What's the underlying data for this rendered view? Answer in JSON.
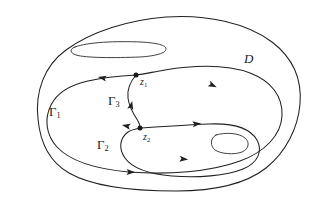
{
  "figure": {
    "kind": "contour-diagram",
    "background_color": "#ffffff",
    "ink_color": "#231f20",
    "labels": {
      "domain": {
        "text": "D",
        "x": 244,
        "y": 52
      },
      "gamma1": {
        "base": "Γ",
        "sub": "1",
        "x": 49,
        "y": 105
      },
      "gamma2": {
        "base": "Γ",
        "sub": "2",
        "x": 97,
        "y": 138
      },
      "gamma3": {
        "base": "Γ",
        "sub": "3",
        "x": 108,
        "y": 94
      },
      "z1": {
        "base": "z",
        "sub": "1",
        "x": 140,
        "y": 77
      },
      "z2": {
        "base": "z",
        "sub": "2",
        "x": 143,
        "y": 132
      }
    },
    "nodes": [
      {
        "name": "z1",
        "cx": 136,
        "cy": 75,
        "r": 2.5
      },
      {
        "name": "z2",
        "cx": 140,
        "cy": 128,
        "r": 2.5
      }
    ],
    "paths": {
      "outer_boundary": "M 38 119 C 35 92 44 66 66 50 C 92 31 129 20 166 17 C 206 14 247 23 272 42 C 293 58 302 80 300 104 C 298 128 286 152 266 168 C 243 186 210 191 176 191 C 137 191 95 188 69 173 C 48 161 40 141 38 119 Z",
      "slit_hole": "M 75 47 C 88 42 116 41 141 42 C 157 43 166 45 166 49 C 166 53 156 56 140 57 C 114 58 86 58 76 55 C 70 53 69 49 75 47 Z",
      "gamma1": "M 136 75 C 118 76 101 78 88 81 C 70 85 57 93 51 105 C 44 119 46 135 57 147 C 70 161 96 169 129 172 C 168 175 210 172 240 161 C 265 152 281 135 282 116 C 283 96 271 81 250 73 C 224 63 188 66 165 70 C 153 72 144 74 136 75 Z",
      "gamma2": "M 140 128 C 160 127 186 125 209 124 C 232 123 250 128 257 140 C 263 151 258 163 243 169 C 226 176 197 178 172 176 C 149 174 132 168 125 158 C 118 148 120 138 128 132 C 131 130 135 129 140 128 Z",
      "gamma3": "M 136 75 C 130 82 127 90 128 98 C 129 107 134 115 138 121 C 140 124 140 126 140 128",
      "blob_hole": "M 216 135 C 226 132 239 133 245 138 C 250 142 249 149 242 152 C 234 155 221 154 215 150 C 210 146 210 138 216 135 Z"
    },
    "arrows": [
      {
        "name": "gamma1-top-left",
        "x": 103,
        "y": 78,
        "angle": 190
      },
      {
        "name": "gamma1-upper-right",
        "x": 212,
        "y": 85,
        "angle": 25
      },
      {
        "name": "gamma1-bottom",
        "x": 130,
        "y": 172,
        "angle": 2
      },
      {
        "name": "gamma1-near-z2",
        "x": 127,
        "y": 126,
        "angle": 192
      },
      {
        "name": "gamma2-top",
        "x": 196,
        "y": 124,
        "angle": 354
      },
      {
        "name": "gamma2-bottom",
        "x": 183,
        "y": 159,
        "angle": 5
      },
      {
        "name": "gamma3-mid",
        "x": 131,
        "y": 106,
        "angle": 283
      }
    ]
  }
}
